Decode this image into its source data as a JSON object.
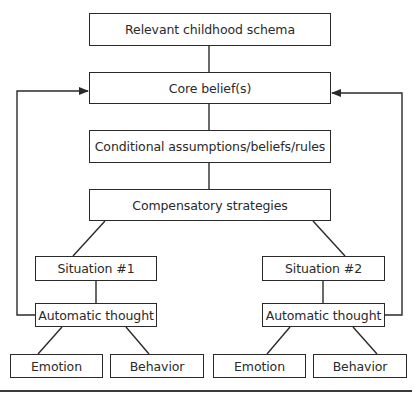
{
  "diagram": {
    "type": "cognitive-conceptualization-diagram",
    "colors": {
      "stroke": "#2a2a2a",
      "text": "#2a2a2a",
      "background": "#ffffff"
    },
    "nodes": {
      "schema": "Relevant childhood schema",
      "core_belief": "Core belief(s)",
      "conditional": "Conditional assumptions/beliefs/rules",
      "compensatory": "Compensatory strategies",
      "situation1": "Situation #1",
      "auto_thought1": "Automatic thought",
      "emotion1": "Emotion",
      "behavior1": "Behavior",
      "situation2": "Situation #2",
      "auto_thought2": "Automatic thought",
      "emotion2": "Emotion",
      "behavior2": "Behavior"
    },
    "edges": [
      {
        "from": "schema",
        "to": "core_belief",
        "arrow": false
      },
      {
        "from": "core_belief",
        "to": "conditional",
        "arrow": false
      },
      {
        "from": "conditional",
        "to": "compensatory",
        "arrow": false
      },
      {
        "from": "compensatory",
        "to": "situation1",
        "arrow": false
      },
      {
        "from": "compensatory",
        "to": "situation2",
        "arrow": false
      },
      {
        "from": "situation1",
        "to": "auto_thought1",
        "arrow": false
      },
      {
        "from": "situation2",
        "to": "auto_thought2",
        "arrow": false
      },
      {
        "from": "auto_thought1",
        "to": "emotion1",
        "arrow": false
      },
      {
        "from": "auto_thought1",
        "to": "behavior1",
        "arrow": false
      },
      {
        "from": "auto_thought2",
        "to": "emotion2",
        "arrow": false
      },
      {
        "from": "auto_thought2",
        "to": "behavior2",
        "arrow": false
      },
      {
        "from": "auto_thought1",
        "to": "core_belief",
        "arrow": true,
        "route": "left-feedback"
      },
      {
        "from": "auto_thought2",
        "to": "core_belief",
        "arrow": true,
        "route": "right-feedback"
      }
    ]
  }
}
